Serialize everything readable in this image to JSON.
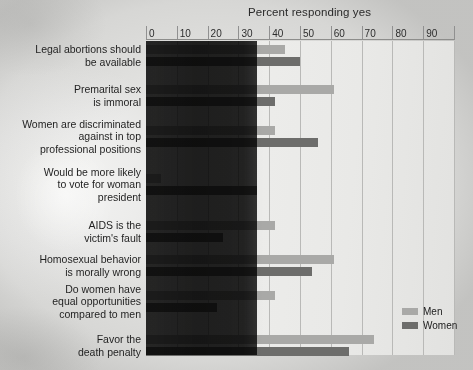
{
  "chart_data": {
    "type": "bar",
    "orientation": "horizontal",
    "title": "Percent responding yes",
    "xlabel": "",
    "ylabel": "",
    "xlim": [
      0,
      100
    ],
    "xticks": [
      0,
      10,
      20,
      30,
      40,
      50,
      60,
      70,
      80,
      90
    ],
    "grid": true,
    "legend_position": "bottom-right",
    "categories": [
      "Legal abortions should be available",
      "Premarital sex is immoral",
      "Women are discriminated against in top professional positions",
      "Would be more likely to vote for woman president",
      "AIDS is the victim's fault",
      "Homosexual behavior is morally wrong",
      "Do women have equal opportunities compared to men",
      "Favor the death penalty"
    ],
    "category_lines": [
      [
        "Legal abortions should",
        "be available"
      ],
      [
        "Premarital sex",
        "is immoral"
      ],
      [
        "Women are discriminated",
        "against in top",
        "professional positions"
      ],
      [
        "Would be more likely",
        "to vote for woman",
        "president"
      ],
      [
        "AIDS is the",
        "victim's fault"
      ],
      [
        "Homosexual behavior",
        "is morally wrong"
      ],
      [
        "Do women have",
        "equal opportunities",
        "compared to men"
      ],
      [
        "Favor the",
        "death penalty"
      ]
    ],
    "series": [
      {
        "name": "Men",
        "color": "#a9a9a7",
        "values": [
          45,
          61,
          42,
          5,
          42,
          61,
          42,
          74
        ]
      },
      {
        "name": "Women",
        "color": "#6d6d6b",
        "values": [
          50,
          42,
          56,
          36,
          25,
          54,
          23,
          66
        ]
      }
    ]
  },
  "legend": {
    "items": [
      {
        "label": "Men",
        "color": "#a9a9a7"
      },
      {
        "label": "Women",
        "color": "#6d6d6b"
      }
    ]
  },
  "axis": {
    "title": "Percent responding yes",
    "tick_labels": [
      "0",
      "10",
      "20",
      "30",
      "40",
      "50",
      "60",
      "70",
      "80",
      "90"
    ]
  },
  "colors": {
    "men": "#a9a9a7",
    "women": "#6d6d6b",
    "plot_background": "#e9e9e7",
    "gridline": "#b9b9b7",
    "text": "#1f1f1f"
  }
}
